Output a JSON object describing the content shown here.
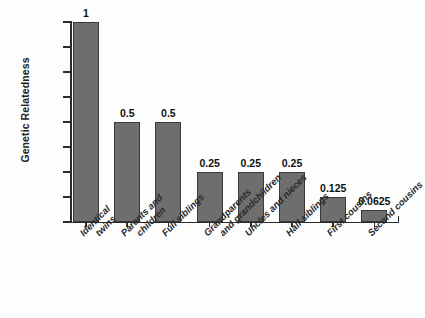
{
  "chart_data": {
    "type": "bar",
    "title": "",
    "xlabel": "",
    "ylabel": "Genetic Relatedness",
    "ylim": [
      0,
      1
    ],
    "grid": false,
    "legend": "none",
    "categories": [
      "Identical twins",
      "Parents and children",
      "Full siblings",
      "Grandparents and grandchildren",
      "Uncles and nieces",
      "Half siblings",
      "First cousins",
      "Second cousins"
    ],
    "category_lines": [
      [
        "Identical",
        "twins"
      ],
      [
        "Parents and",
        "children"
      ],
      [
        "Full siblings"
      ],
      [
        "Grandparents",
        "and grandchildren"
      ],
      [
        "Uncles and nieces"
      ],
      [
        "Half siblings"
      ],
      [
        "First cousins"
      ],
      [
        "Second cousins"
      ]
    ],
    "values": [
      1,
      0.5,
      0.5,
      0.25,
      0.25,
      0.25,
      0.125,
      0.0625
    ],
    "value_labels": [
      "1",
      "0.5",
      "0.5",
      "0.25",
      "0.25",
      "0.25",
      "0.125",
      "0.0625"
    ],
    "yticks": [
      0,
      0.125,
      0.25,
      0.375,
      0.5,
      0.625,
      0.75,
      0.875,
      1
    ],
    "ytick_labels": [
      "0",
      "0.125",
      "0.25",
      "0.375",
      "0.5",
      "0.625",
      "0.75",
      "0.875",
      "1"
    ],
    "colors": {
      "bar_fill": "#6e6e6e",
      "bar_edge": "#3a3a3a",
      "axis": "#2b2b2b",
      "text": "#1c1c1c",
      "background": "#fdfdfd"
    }
  }
}
